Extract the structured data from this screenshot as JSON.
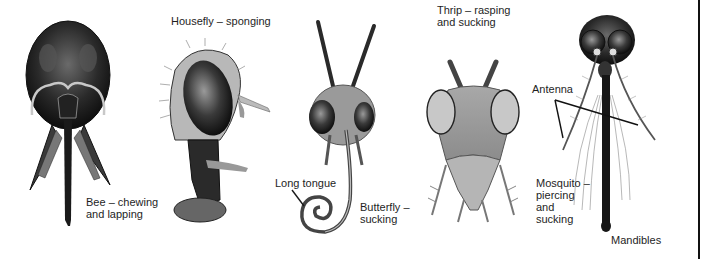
{
  "figure": {
    "colors": {
      "background": "#ffffff",
      "ink": "#1e1e1e",
      "rule": "#111111"
    }
  },
  "specimens": [
    {
      "id": "bee",
      "icon": "bee-head-icon",
      "label_lines": [
        "Bee – chewing",
        "and lapping"
      ]
    },
    {
      "id": "housefly",
      "icon": "housefly-head-icon",
      "label_lines": [
        "Housefly – sponging"
      ]
    },
    {
      "id": "butterfly",
      "icon": "butterfly-head-icon",
      "label_lines": [
        "Butterfly –",
        "sucking"
      ]
    },
    {
      "id": "thrip",
      "icon": "thrip-head-icon",
      "label_lines": [
        "Thrip – rasping",
        "and sucking"
      ]
    },
    {
      "id": "mosquito",
      "icon": "mosquito-head-icon",
      "label_lines": [
        "Mosquito –",
        "piercing",
        "and",
        "sucking"
      ]
    }
  ],
  "callouts": {
    "long_tongue": "Long tongue",
    "antenna": "Antenna",
    "mandibles": "Mandibles"
  }
}
